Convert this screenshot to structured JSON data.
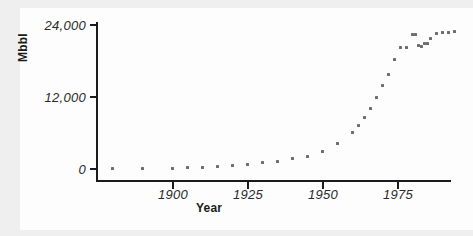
{
  "figure": {
    "background_color": "#efefef",
    "panel_color": "#fdfdfd",
    "axis_color": "#1b1b1b",
    "marker_color": "#6c6c74"
  },
  "chart_data": {
    "type": "scatter",
    "title": "",
    "xlabel": "Year",
    "ylabel": "Mbbl",
    "xlim": [
      1880,
      1996
    ],
    "ylim": [
      -1000,
      25500
    ],
    "grid": false,
    "legend": null,
    "xticks": [
      1900,
      1925,
      1950,
      1975
    ],
    "xtick_labels": [
      "1900",
      "1925",
      "1950",
      "1975"
    ],
    "yticks": [
      0,
      12000,
      24000
    ],
    "ytick_labels": [
      "0",
      "12,000",
      "24,000"
    ],
    "series": [
      {
        "name": "Mbbl",
        "x": [
          1880,
          1890,
          1900,
          1905,
          1910,
          1915,
          1920,
          1925,
          1930,
          1935,
          1940,
          1945,
          1950,
          1955,
          1960,
          1962,
          1964,
          1966,
          1968,
          1970,
          1972,
          1974,
          1976,
          1978,
          1980,
          1981,
          1982,
          1983,
          1984,
          1985,
          1986,
          1988,
          1990,
          1992,
          1994
        ],
        "y": [
          50,
          100,
          150,
          200,
          280,
          400,
          550,
          800,
          1100,
          1300,
          1700,
          2100,
          3000,
          4200,
          6100,
          7200,
          8600,
          10100,
          11900,
          13900,
          15800,
          18200,
          20200,
          20300,
          22400,
          22400,
          20600,
          20400,
          20900,
          21000,
          21800,
          22600,
          22700,
          22800,
          22900
        ]
      }
    ]
  }
}
